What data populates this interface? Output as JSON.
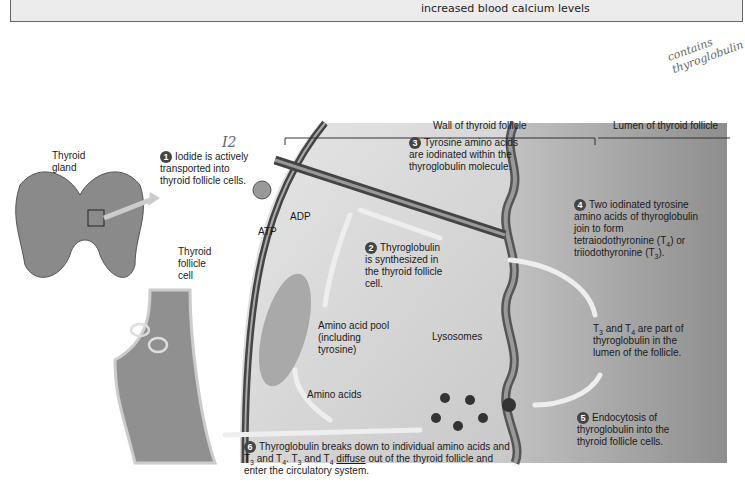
{
  "header": {
    "caption": "increased blood calcium levels"
  },
  "handwriting": {
    "note_line1": "contains",
    "note_line2": "thyroglobulin",
    "iodide_symbol": "I2"
  },
  "regions": {
    "wall": "Wall of thyroid follicle",
    "lumen": "Lumen of thyroid follicle"
  },
  "labels": {
    "gland": "Thyroid gland",
    "follicle_cell": "Thyroid follicle cell",
    "atp": "ATP",
    "adp": "ADP",
    "amino_pool": "Amino acid pool (including tyrosine)",
    "lysosomes": "Lysosomes",
    "amino_acids": "Amino acids"
  },
  "steps": [
    {
      "n": "1",
      "text": "Iodide is actively transported into thyroid follicle cells."
    },
    {
      "n": "2",
      "text": "Thyroglobulin is synthesized in the thyroid follicle cell."
    },
    {
      "n": "3",
      "text": "Tyrosine amino acids are iodinated within the thyroglobulin molecule."
    },
    {
      "n": "4",
      "text_a": "Two iodinated tyrosine amino acids of thyroglobulin join to form tetraiodothyronine (T",
      "sub_a": "4",
      "text_b": ") or triiodothyronine (T",
      "sub_b": "3",
      "text_c": ")."
    },
    {
      "n": "",
      "text_a": "T",
      "sub_a": "3",
      "text_b": " and T",
      "sub_b": "4",
      "text_c": " are part of thyroglobulin in the lumen of the follicle."
    },
    {
      "n": "5",
      "text": "Endocytosis of thyroglobulin into the thyroid follicle cells."
    },
    {
      "n": "6",
      "line1": "Thyroglobulin breaks down to individual amino acids and",
      "t3": "3",
      "t4": "4",
      "and": " and T",
      "dot": ". T",
      "diffuse": "diffuse",
      "rest": " out of the thyroid follicle and",
      "line3": "enter the circulatory system."
    }
  ],
  "colors": {
    "cell_fill": "#d4d4d4",
    "lumen_fill": "#a8a8a8",
    "membrane": "#555555",
    "arrow": "#e8e8e8"
  }
}
